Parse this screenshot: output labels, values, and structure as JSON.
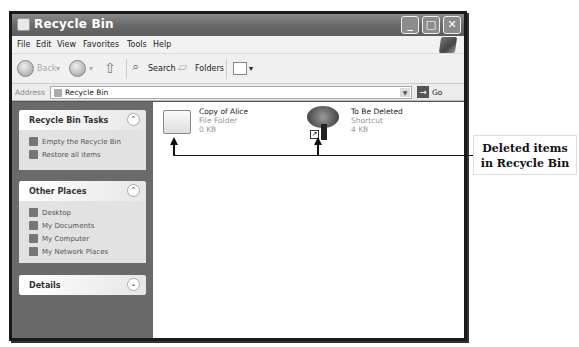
{
  "window": {
    "title": "Recycle Bin",
    "controls": {
      "minimize": "_",
      "maximize": "□",
      "close": "✕"
    }
  },
  "menubar": {
    "items": [
      "File",
      "Edit",
      "View",
      "Favorites",
      "Tools",
      "Help"
    ]
  },
  "toolbar": {
    "back_label": "Back",
    "search_label": "Search",
    "folders_label": "Folders",
    "views_dropdown": "▾"
  },
  "address": {
    "label": "Address",
    "value": "Recycle Bin",
    "go_label": "Go"
  },
  "sidebar": {
    "panels": [
      {
        "title": "Recycle Bin Tasks",
        "chevron": "⌃",
        "items": [
          "Empty the Recycle Bin",
          "Restore all items"
        ]
      },
      {
        "title": "Other Places",
        "chevron": "⌃",
        "items": [
          "Desktop",
          "My Documents",
          "My Computer",
          "My Network Places"
        ]
      },
      {
        "title": "Details",
        "chevron": "⌄",
        "items": []
      }
    ]
  },
  "content": {
    "items": [
      {
        "name": "Copy of Alice",
        "type": "File Folder",
        "size": "0 KB",
        "icon": "folder-icon"
      },
      {
        "name": "To Be Deleted",
        "type": "Shortcut",
        "size": "4 KB",
        "icon": "tree-shortcut-icon"
      }
    ]
  },
  "annotation": {
    "line1": "Deleted items",
    "line2": "in Recycle Bin"
  }
}
